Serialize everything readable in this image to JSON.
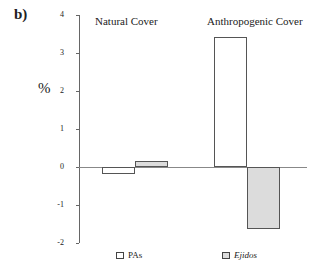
{
  "panel_label": "b)",
  "chart_data": {
    "type": "bar",
    "title": "",
    "xlabel": "",
    "ylabel": "%",
    "ylim": [
      -2,
      4
    ],
    "yticks": [
      "4",
      "3",
      "2",
      "1",
      "0",
      "-1",
      "-2"
    ],
    "grid": false,
    "legend_position": "bottom",
    "categories": [
      "Natural Cover",
      "Anthropogenic Cover"
    ],
    "series": [
      {
        "name": "PAs",
        "color": "#ffffff",
        "values": [
          -0.18,
          3.42
        ]
      },
      {
        "name": "Ejidos",
        "color": "#dcdcdc",
        "values": [
          0.15,
          -1.63
        ]
      }
    ]
  },
  "legend": {
    "pas": "PAs",
    "ejidos": "Ejidos"
  }
}
